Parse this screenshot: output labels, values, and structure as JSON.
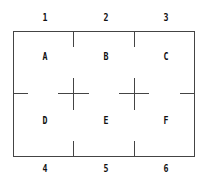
{
  "column_labels_top": [
    "1",
    "2",
    "3"
  ],
  "column_labels_bottom": [
    "4",
    "5",
    "6"
  ],
  "cells": [
    "A",
    "B",
    "C",
    "D",
    "E",
    "F"
  ],
  "colors": {
    "line": "#333333",
    "text": "#111111",
    "background": "#ffffff"
  }
}
